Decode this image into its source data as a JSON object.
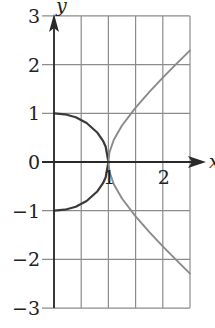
{
  "chart_data": {
    "type": "line",
    "title": "",
    "xlabel": "x",
    "ylabel": "y",
    "xlim": [
      0,
      2.5
    ],
    "ylim": [
      -3,
      3
    ],
    "grid": true,
    "grid_x_step": 0.5,
    "grid_y_step": 1,
    "x_ticks": [
      {
        "value": 1,
        "label": "1"
      },
      {
        "value": 2,
        "label": "2"
      }
    ],
    "y_ticks": [
      {
        "value": 3,
        "label": "3"
      },
      {
        "value": 2,
        "label": "2"
      },
      {
        "value": 1,
        "label": "1"
      },
      {
        "value": 0,
        "label": "0"
      },
      {
        "value": -1,
        "label": "−1"
      },
      {
        "value": -2,
        "label": "−2"
      },
      {
        "value": -3,
        "label": "−3"
      }
    ],
    "legend": null,
    "series": [
      {
        "name": "semicircle x^2 + y^2 = 1",
        "color": "#3a3a3a",
        "points": [
          [
            0,
            1
          ],
          [
            0.2,
            0.98
          ],
          [
            0.4,
            0.917
          ],
          [
            0.6,
            0.8
          ],
          [
            0.8,
            0.6
          ],
          [
            0.9,
            0.436
          ],
          [
            0.95,
            0.312
          ],
          [
            1,
            0
          ],
          [
            0.95,
            -0.312
          ],
          [
            0.9,
            -0.436
          ],
          [
            0.8,
            -0.6
          ],
          [
            0.6,
            -0.8
          ],
          [
            0.4,
            -0.917
          ],
          [
            0.2,
            -0.98
          ],
          [
            0,
            -1
          ]
        ]
      },
      {
        "name": "upper branch y = sqrt(x^2 - 1)",
        "color": "#8a8a8a",
        "points": [
          [
            1,
            0
          ],
          [
            1.02,
            0.2
          ],
          [
            1.1,
            0.458
          ],
          [
            1.25,
            0.75
          ],
          [
            1.5,
            1.118
          ],
          [
            1.75,
            1.436
          ],
          [
            2,
            1.732
          ],
          [
            2.25,
            2.016
          ],
          [
            2.5,
            2.291
          ]
        ]
      },
      {
        "name": "lower branch y = -sqrt(x^2 - 1)",
        "color": "#8a8a8a",
        "points": [
          [
            1,
            0
          ],
          [
            1.02,
            -0.2
          ],
          [
            1.1,
            -0.458
          ],
          [
            1.25,
            -0.75
          ],
          [
            1.5,
            -1.118
          ],
          [
            1.75,
            -1.436
          ],
          [
            2,
            -1.732
          ],
          [
            2.25,
            -2.016
          ],
          [
            2.5,
            -2.291
          ]
        ]
      }
    ],
    "colors": {
      "grid": "#8c8c8c",
      "axis": "#2a2a2a",
      "background": "#ffffff"
    }
  }
}
